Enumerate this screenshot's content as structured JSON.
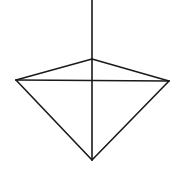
{
  "diagram": {
    "type": "line-drawing",
    "stroke_color": "#1a1a1a",
    "background": "#ffffff",
    "stroke_width": 1.6,
    "vertices": {
      "apex": [
        92,
        59
      ],
      "left": [
        16,
        80
      ],
      "right": [
        169,
        81
      ],
      "bottom": [
        92,
        160
      ],
      "axis_top": [
        92,
        0
      ]
    },
    "segments": [
      {
        "name": "vertical-axis",
        "from": "axis_top",
        "to": "bottom"
      },
      {
        "name": "apex-left-edge",
        "from": "apex",
        "to": "left"
      },
      {
        "name": "apex-right-edge",
        "from": "apex",
        "to": "right"
      },
      {
        "name": "horizontal-crossbar",
        "from": "left",
        "to": "right"
      },
      {
        "name": "left-lower-edge",
        "from": "left",
        "to": "bottom"
      },
      {
        "name": "right-lower-edge",
        "from": "right",
        "to": "bottom"
      }
    ]
  }
}
